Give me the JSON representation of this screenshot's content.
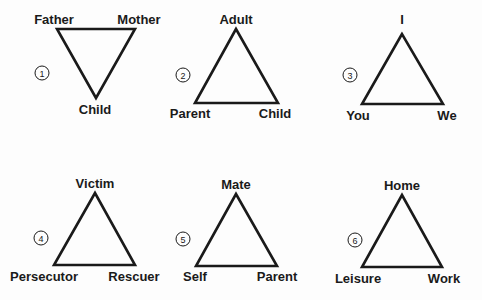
{
  "diagram": {
    "type": "relationship-triangles",
    "colors": {
      "line": "#1a1a1a",
      "background": "#fdfdfd"
    },
    "triangles": [
      {
        "number": "1",
        "orientation": "inverted",
        "vertices": {
          "top_left": "Father",
          "top_right": "Mother",
          "bottom": "Child"
        }
      },
      {
        "number": "2",
        "orientation": "upright",
        "vertices": {
          "top": "Adult",
          "bottom_left": "Parent",
          "bottom_right": "Child"
        }
      },
      {
        "number": "3",
        "orientation": "upright",
        "vertices": {
          "top": "I",
          "bottom_left": "You",
          "bottom_right": "We"
        }
      },
      {
        "number": "4",
        "orientation": "upright",
        "vertices": {
          "top": "Victim",
          "bottom_left": "Persecutor",
          "bottom_right": "Rescuer"
        }
      },
      {
        "number": "5",
        "orientation": "upright",
        "vertices": {
          "top": "Mate",
          "bottom_left": "Self",
          "bottom_right": "Parent"
        }
      },
      {
        "number": "6",
        "orientation": "upright",
        "vertices": {
          "top": "Home",
          "bottom_left": "Leisure",
          "bottom_right": "Work"
        }
      }
    ]
  }
}
